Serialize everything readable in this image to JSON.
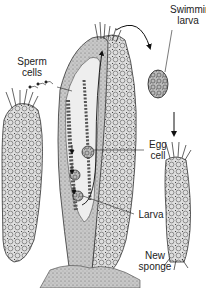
{
  "labels": {
    "swimming_larva": {
      "line1": "Swimming",
      "line2": "larva"
    },
    "sperm_cells": {
      "line1": "Sperm",
      "line2": "cells"
    },
    "egg_cell": {
      "line1": "Egg",
      "line2": "cell"
    },
    "larva": {
      "line1": "Larva"
    },
    "new_sponge": {
      "line1": "New",
      "line2": "sponge"
    }
  },
  "colors": {
    "ink": "#222222",
    "shade": "#8a8a8a",
    "light_shade": "#cfcfcf",
    "background": "#ffffff"
  }
}
